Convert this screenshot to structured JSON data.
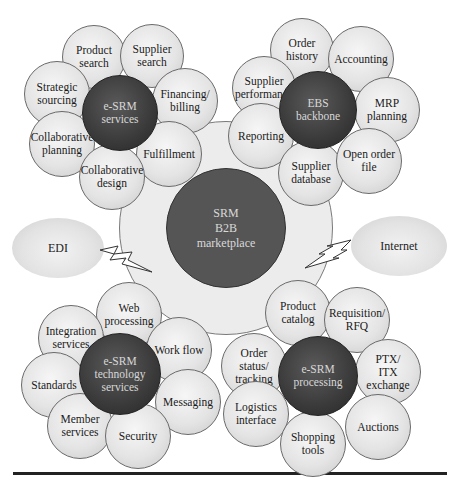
{
  "diagram": {
    "center": {
      "label": "SRM\nB2B\nmarketplace",
      "x": 226,
      "y": 228,
      "r": 60,
      "ring_r": 107,
      "colors": {
        "core": "#555555",
        "ring": "#ececec"
      }
    },
    "connectors": [
      {
        "id": "edi",
        "label": "EDI",
        "x": 58,
        "y": 248,
        "w": 92,
        "h": 60
      },
      {
        "id": "internet",
        "label": "Internet",
        "x": 399,
        "y": 246,
        "w": 96,
        "h": 60
      }
    ],
    "clusters": [
      {
        "id": "esrm-services",
        "hub": {
          "label": "e-SRM\nservices",
          "x": 120,
          "y": 113,
          "r": 38
        },
        "petals": [
          {
            "label": "Product\nsearch",
            "x": 94,
            "y": 57,
            "r": 32
          },
          {
            "label": "Supplier\nsearch",
            "x": 152,
            "y": 56,
            "r": 32
          },
          {
            "label": "Strategic\nsourcing",
            "x": 57,
            "y": 94,
            "r": 33
          },
          {
            "label": "Financing/\nbilling",
            "x": 185,
            "y": 101,
            "r": 33
          },
          {
            "label": "Collaborative\nplanning",
            "x": 62,
            "y": 144,
            "r": 33
          },
          {
            "label": "Fulfillment",
            "x": 169,
            "y": 154,
            "r": 33
          },
          {
            "label": "Collaborative\ndesign",
            "x": 112,
            "y": 177,
            "r": 33
          }
        ]
      },
      {
        "id": "ebs-backbone",
        "hub": {
          "label": "EBS\nbackbone",
          "x": 318,
          "y": 110,
          "r": 39
        },
        "petals": [
          {
            "label": "Order\nhistory",
            "x": 302,
            "y": 50,
            "r": 32
          },
          {
            "label": "Accounting",
            "x": 361,
            "y": 59,
            "r": 33
          },
          {
            "label": "Supplier\nperformance",
            "x": 264,
            "y": 88,
            "r": 32
          },
          {
            "label": "MRP\nplanning",
            "x": 387,
            "y": 110,
            "r": 33
          },
          {
            "label": "Reporting",
            "x": 261,
            "y": 136,
            "r": 33
          },
          {
            "label": "Supplier\ndatabase",
            "x": 311,
            "y": 173,
            "r": 33
          },
          {
            "label": "Open order\nfile",
            "x": 369,
            "y": 161,
            "r": 33
          }
        ]
      },
      {
        "id": "esrm-technology-services",
        "hub": {
          "label": "e-SRM\ntechnology\nservices",
          "x": 120,
          "y": 374,
          "r": 41
        },
        "petals": [
          {
            "label": "Web\nprocessing",
            "x": 129,
            "y": 315,
            "r": 33
          },
          {
            "label": "Integration\nservices",
            "x": 71,
            "y": 338,
            "r": 33
          },
          {
            "label": "Work flow",
            "x": 179,
            "y": 350,
            "r": 33
          },
          {
            "label": "Standards",
            "x": 54,
            "y": 385,
            "r": 33
          },
          {
            "label": "Messaging",
            "x": 188,
            "y": 402,
            "r": 33
          },
          {
            "label": "Member\nservices",
            "x": 80,
            "y": 426,
            "r": 33
          },
          {
            "label": "Security",
            "x": 138,
            "y": 436,
            "r": 33
          }
        ]
      },
      {
        "id": "esrm-processing",
        "hub": {
          "label": "e-SRM\nprocessing",
          "x": 318,
          "y": 376,
          "r": 40
        },
        "petals": [
          {
            "label": "Product\ncatalog",
            "x": 298,
            "y": 313,
            "r": 33
          },
          {
            "label": "Requisition/\nRFQ",
            "x": 357,
            "y": 320,
            "r": 33
          },
          {
            "label": "Order\nstatus/\ntracking",
            "x": 254,
            "y": 366,
            "r": 33
          },
          {
            "label": "PTX/\nITX\nexchange",
            "x": 388,
            "y": 372,
            "r": 33
          },
          {
            "label": "Logistics\ninterface",
            "x": 256,
            "y": 414,
            "r": 33
          },
          {
            "label": "Auctions",
            "x": 378,
            "y": 427,
            "r": 33
          },
          {
            "label": "Shopping\ntools",
            "x": 313,
            "y": 444,
            "r": 33
          }
        ]
      }
    ]
  }
}
